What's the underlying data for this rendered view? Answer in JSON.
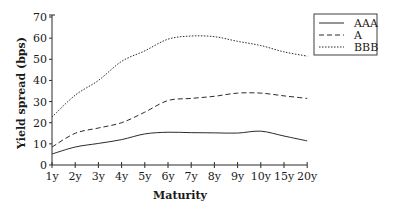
{
  "chart_data": {
    "type": "line",
    "title": "",
    "xlabel": "Maturity",
    "ylabel": "Yield spread (bps)",
    "categories": [
      "1y",
      "2y",
      "3y",
      "4y",
      "5y",
      "6y",
      "7y",
      "8y",
      "9y",
      "10y",
      "15y",
      "20y"
    ],
    "ylim": [
      0,
      70
    ],
    "yticks": [
      0,
      10,
      20,
      30,
      40,
      50,
      60,
      70
    ],
    "grid": false,
    "legend_position": "top-right",
    "series": [
      {
        "name": "AAA",
        "style": "solid",
        "values": [
          5.2,
          8.5,
          10.2,
          12,
          14.7,
          15.5,
          15.3,
          15.2,
          15.1,
          16,
          13.7,
          11.4
        ]
      },
      {
        "name": "A",
        "style": "dashed",
        "values": [
          8.5,
          15,
          17.5,
          20,
          25,
          30.5,
          31.5,
          32.5,
          34,
          34,
          32.7,
          31.5
        ]
      },
      {
        "name": "BBB",
        "style": "dotted",
        "values": [
          22.7,
          33,
          40,
          49,
          54,
          59.5,
          61,
          60.7,
          58.5,
          56.5,
          53.5,
          51.5
        ]
      }
    ]
  },
  "legend": {
    "items": [
      {
        "label": "AAA"
      },
      {
        "label": "A"
      },
      {
        "label": "BBB"
      }
    ]
  },
  "colors": {
    "line": "#2b2b2b",
    "axis": "#2b2b2b",
    "background": "#ffffff"
  }
}
